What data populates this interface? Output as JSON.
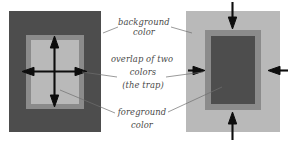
{
  "figure": {
    "title_fragment_top": "",
    "labels": {
      "background": {
        "line1": "background",
        "line2": "color"
      },
      "overlap": {
        "line1": "overlap of two",
        "line2": "colors",
        "line3": "(the trap)"
      },
      "foreground": {
        "line1": "foreground",
        "line2": "color"
      }
    }
  },
  "colors": {
    "page_background": "#ffffff",
    "dark_gray": "#4d4d4d",
    "mid_gray": "#898989",
    "light_gray": "#b8b8b8",
    "arrow_black": "#0d0d0d",
    "leader_line": "#6f6f6f",
    "text_gray": "#4a4a4a"
  },
  "panels": {
    "left": {
      "name": "knockout-panel",
      "background_color_layer": "dark_gray",
      "trap_ring_layer": "mid_gray",
      "foreground_color_layer": "light_gray",
      "arrows": [
        "up",
        "down",
        "left",
        "right"
      ],
      "arrow_direction": "outward"
    },
    "right": {
      "name": "overprint-panel",
      "background_color_layer": "light_gray",
      "trap_ring_layer": "mid_gray",
      "foreground_color_layer": "dark_gray",
      "arrows": [
        "down",
        "up",
        "right",
        "left"
      ],
      "arrow_direction": "inward"
    }
  },
  "icons": {
    "arrow_up": "arrow-up-icon",
    "arrow_down": "arrow-down-icon",
    "arrow_left": "arrow-left-icon",
    "arrow_right": "arrow-right-icon"
  }
}
